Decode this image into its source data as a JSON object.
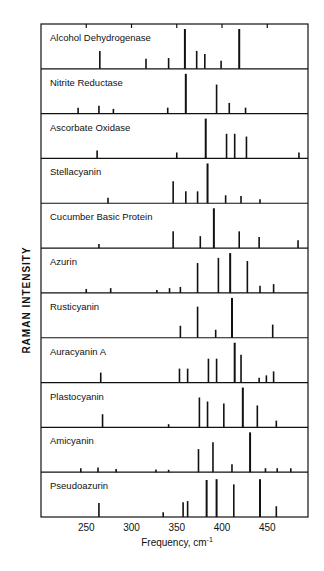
{
  "chart_data": {
    "type": "bar",
    "subtype": "stacked stick spectra",
    "title": "",
    "xlabel": "Frequency, cm-1",
    "ylabel": "RAMAN   INTENSITY",
    "xlim": [
      200,
      495
    ],
    "xticks": [
      250,
      300,
      350,
      400,
      450
    ],
    "grid": false,
    "legend": "none (panel labels inside each panel)",
    "panels": [
      {
        "name": "Alcohol Dehydrogenase",
        "lines": [
          [
            265,
            0.45
          ],
          [
            316,
            0.25
          ],
          [
            341,
            0.27
          ],
          [
            359,
            1.0
          ],
          [
            372,
            0.45
          ],
          [
            381,
            0.37
          ],
          [
            399,
            0.2
          ],
          [
            419,
            1.0
          ]
        ]
      },
      {
        "name": "Nitrite Reductase",
        "lines": [
          [
            241,
            0.15
          ],
          [
            264,
            0.2
          ],
          [
            280,
            0.12
          ],
          [
            340,
            0.15
          ],
          [
            360,
            1.0
          ],
          [
            394,
            0.73
          ],
          [
            408,
            0.27
          ],
          [
            426,
            0.15
          ]
        ]
      },
      {
        "name": "Ascorbate Oxidase",
        "lines": [
          [
            262,
            0.2
          ],
          [
            350,
            0.15
          ],
          [
            382,
            1.0
          ],
          [
            405,
            0.62
          ],
          [
            414,
            0.62
          ],
          [
            427,
            0.55
          ],
          [
            485,
            0.15
          ]
        ]
      },
      {
        "name": "Stellacyanin",
        "lines": [
          [
            274,
            0.14
          ],
          [
            346,
            0.55
          ],
          [
            360,
            0.3
          ],
          [
            373,
            0.3
          ],
          [
            384,
            1.0
          ],
          [
            404,
            0.2
          ],
          [
            421,
            0.18
          ],
          [
            442,
            0.1
          ]
        ]
      },
      {
        "name": "Cucumber Basic Protein",
        "lines": [
          [
            264,
            0.1
          ],
          [
            346,
            0.42
          ],
          [
            376,
            0.3
          ],
          [
            391,
            1.0
          ],
          [
            419,
            0.42
          ],
          [
            441,
            0.28
          ],
          [
            484,
            0.2
          ]
        ]
      },
      {
        "name": "Azurin",
        "lines": [
          [
            250,
            0.1
          ],
          [
            277,
            0.12
          ],
          [
            328,
            0.07
          ],
          [
            342,
            0.12
          ],
          [
            354,
            0.15
          ],
          [
            373,
            0.75
          ],
          [
            396,
            0.88
          ],
          [
            409,
            1.0
          ],
          [
            428,
            0.8
          ],
          [
            442,
            0.18
          ],
          [
            457,
            0.22
          ]
        ]
      },
      {
        "name": "Rusticyanin",
        "lines": [
          [
            354,
            0.3
          ],
          [
            373,
            0.78
          ],
          [
            393,
            0.2
          ],
          [
            411,
            1.0
          ],
          [
            456,
            0.33
          ]
        ]
      },
      {
        "name": "Auracyanin A",
        "lines": [
          [
            266,
            0.25
          ],
          [
            353,
            0.35
          ],
          [
            362,
            0.35
          ],
          [
            385,
            0.6
          ],
          [
            394,
            0.6
          ],
          [
            414,
            1.0
          ],
          [
            421,
            0.7
          ],
          [
            441,
            0.12
          ],
          [
            449,
            0.18
          ],
          [
            457,
            0.28
          ]
        ]
      },
      {
        "name": "Plastocyanin",
        "lines": [
          [
            268,
            0.33
          ],
          [
            341,
            0.08
          ],
          [
            375,
            0.75
          ],
          [
            384,
            0.65
          ],
          [
            402,
            0.6
          ],
          [
            423,
            1.0
          ],
          [
            439,
            0.55
          ],
          [
            460,
            0.17
          ]
        ]
      },
      {
        "name": "Amicyanin",
        "lines": [
          [
            244,
            0.1
          ],
          [
            263,
            0.12
          ],
          [
            283,
            0.08
          ],
          [
            327,
            0.07
          ],
          [
            341,
            0.06
          ],
          [
            374,
            0.58
          ],
          [
            390,
            0.75
          ],
          [
            411,
            0.2
          ],
          [
            431,
            1.0
          ],
          [
            448,
            0.1
          ],
          [
            461,
            0.1
          ],
          [
            476,
            0.1
          ]
        ]
      },
      {
        "name": "Pseudoazurin",
        "lines": [
          [
            264,
            0.35
          ],
          [
            335,
            0.12
          ],
          [
            357,
            0.37
          ],
          [
            362,
            0.4
          ],
          [
            383,
            0.93
          ],
          [
            394,
            0.95
          ],
          [
            413,
            0.82
          ],
          [
            442,
            0.95
          ],
          [
            460,
            0.27
          ]
        ]
      }
    ]
  },
  "axis": {
    "x_label": "Frequency, cm",
    "x_label_sup": "-1",
    "y_label": "RAMAN   INTENSITY",
    "tick_labels": [
      "250",
      "300",
      "350",
      "400",
      "450"
    ]
  }
}
